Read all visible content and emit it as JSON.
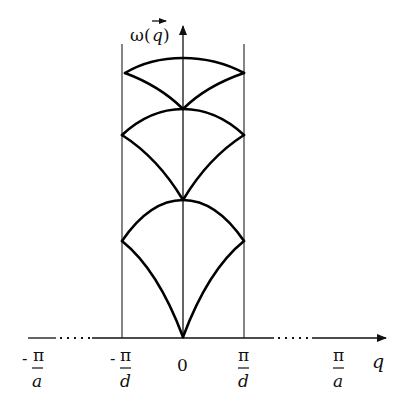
{
  "diagram": {
    "type": "phonon-dispersion-extended-zone",
    "y_axis_label": {
      "symbol": "ω",
      "argument": "q",
      "vector_arrow": true
    },
    "x_axis_label": "q",
    "ticks": [
      {
        "id": "neg-pi-a",
        "sign": "-",
        "numerator": "π",
        "denominator": "a"
      },
      {
        "id": "neg-pi-d",
        "sign": "-",
        "numerator": "π",
        "denominator": "d"
      },
      {
        "id": "zero",
        "text": "0"
      },
      {
        "id": "pi-d",
        "sign": "",
        "numerator": "π",
        "denominator": "d"
      },
      {
        "id": "pi-a",
        "sign": "",
        "numerator": "π",
        "denominator": "a"
      }
    ],
    "branches": [
      {
        "name": "acoustic-branch",
        "count": 1
      },
      {
        "name": "optical-branch-1",
        "count": 1
      },
      {
        "name": "optical-branch-2",
        "count": 1
      }
    ],
    "zone_boundaries": [
      "-π/d",
      "π/d"
    ],
    "axis_breaks": [
      "between -π/a and -π/d",
      "between π/d and π/a"
    ]
  }
}
